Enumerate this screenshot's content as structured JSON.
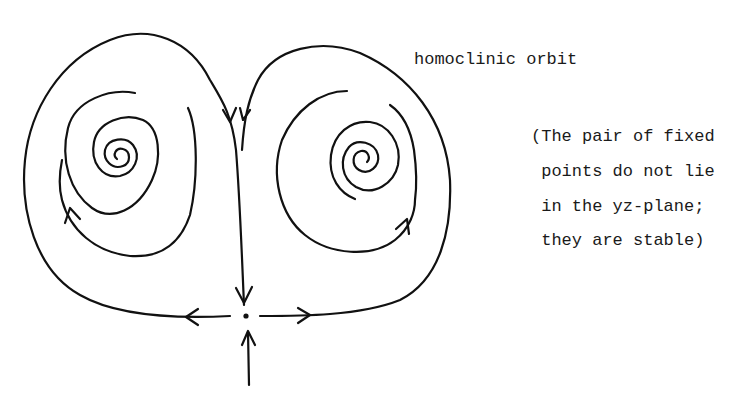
{
  "figure": {
    "type": "phase-portrait",
    "curve_label": "homoclinic orbit",
    "note_lines": [
      "(The pair of fixed",
      " points do not lie",
      " in the yz-plane;",
      " they are stable)"
    ],
    "elements": {
      "saddle_point": "saddle fixed point at origin",
      "left_spiral": "stable spiral fixed point (left)",
      "right_spiral": "stable spiral fixed point (right)",
      "left_homoclinic_loop": "homoclinic orbit loop (left)",
      "right_homoclinic_loop": "homoclinic orbit loop (right)"
    },
    "colors": {
      "ink": "#111111",
      "background": "#ffffff"
    }
  }
}
